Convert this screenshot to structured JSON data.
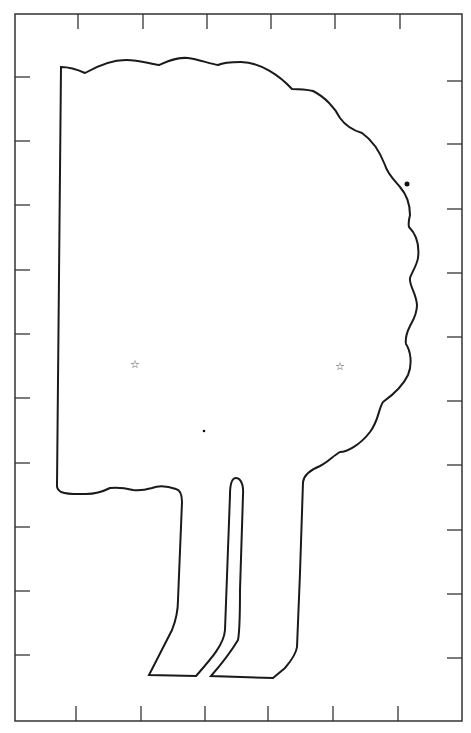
{
  "figure": {
    "type": "outline-diagram",
    "frame": {
      "x": 15,
      "y": 14,
      "width": 447,
      "height": 707
    },
    "ticks": {
      "top_x": [
        78,
        143,
        207,
        271,
        335,
        400
      ],
      "bottom_x": [
        76,
        141,
        205,
        268,
        333,
        398
      ],
      "left_y": [
        77,
        141,
        205,
        270,
        334,
        398,
        463,
        527,
        591,
        655
      ],
      "right_y": [
        81,
        144,
        209,
        273,
        337,
        401,
        465,
        530,
        594,
        658
      ]
    },
    "markers": {
      "stars": [
        {
          "glyph": "☆",
          "x": 136,
          "y": 365
        },
        {
          "glyph": "☆",
          "x": 341,
          "y": 367
        }
      ],
      "dots": [
        {
          "x": 407,
          "y": 184,
          "r": 2.5
        },
        {
          "x": 204,
          "y": 431,
          "r": 1.3
        }
      ]
    },
    "colors": {
      "stroke": "#1a1a1a",
      "background": "#ffffff"
    }
  }
}
